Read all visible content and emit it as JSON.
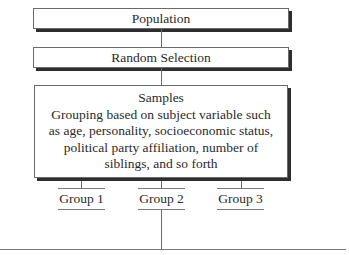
{
  "diagram": {
    "type": "flowchart",
    "nodes": {
      "population": "Population",
      "random_selection": "Random Selection",
      "samples_title": "Samples",
      "samples_lines": [
        "Grouping based on subject variable such",
        "as age, personality, socioeconomic status,",
        "political party affiliation, number of",
        "siblings, and so forth"
      ]
    },
    "groups": [
      "Group 1",
      "Group 2",
      "Group 3"
    ],
    "edges": [
      [
        "Population",
        "Random Selection"
      ],
      [
        "Random Selection",
        "Samples"
      ],
      [
        "Samples",
        "Group 1"
      ],
      [
        "Samples",
        "Group 2"
      ],
      [
        "Samples",
        "Group 3"
      ],
      [
        "Group 2",
        "baseline"
      ]
    ]
  }
}
